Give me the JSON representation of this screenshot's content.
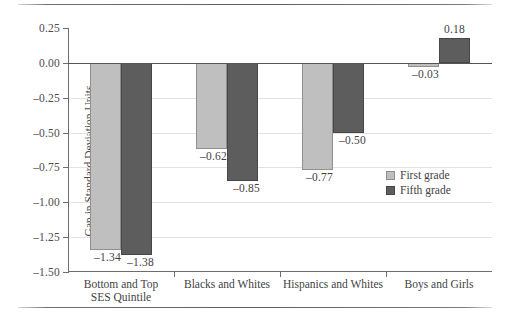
{
  "chart_data": {
    "type": "bar",
    "title": "",
    "subtitle": "",
    "xlabel": "",
    "ylabel": "Gap in Standard Deviation Units",
    "ylim": [
      -1.5,
      0.25
    ],
    "yticks": [
      "0.25",
      "0.00",
      "–0.25",
      "–0.50",
      "–0.75",
      "–1.00",
      "–1.25",
      "–1.50"
    ],
    "ytick_values": [
      0.25,
      0.0,
      -0.25,
      -0.5,
      -0.75,
      -1.0,
      -1.25,
      -1.5
    ],
    "grid": true,
    "legend_position": "right-inside",
    "categories": [
      "Bottom and Top SES Quintile",
      "Blacks and Whites",
      "Hispanics and Whites",
      "Boys and Girls"
    ],
    "category_lines": [
      [
        "Bottom and Top",
        "SES Quintile"
      ],
      [
        "Blacks and Whites"
      ],
      [
        "Hispanics and Whites"
      ],
      [
        "Boys and Girls"
      ]
    ],
    "series": [
      {
        "name": "First grade",
        "color": "#bfbfbf",
        "values": [
          -1.34,
          -0.62,
          -0.77,
          -0.03
        ],
        "labels": [
          "–1.34",
          "–0.62",
          "–0.77",
          "–0.03"
        ]
      },
      {
        "name": "Fifth grade",
        "color": "#5d5d5d",
        "values": [
          -1.38,
          -0.85,
          -0.5,
          0.18
        ],
        "labels": [
          "–1.38",
          "–0.85",
          "–0.50",
          "0.18"
        ]
      }
    ]
  },
  "legend": {
    "items": [
      {
        "label": "First grade"
      },
      {
        "label": "Fifth grade"
      }
    ]
  }
}
